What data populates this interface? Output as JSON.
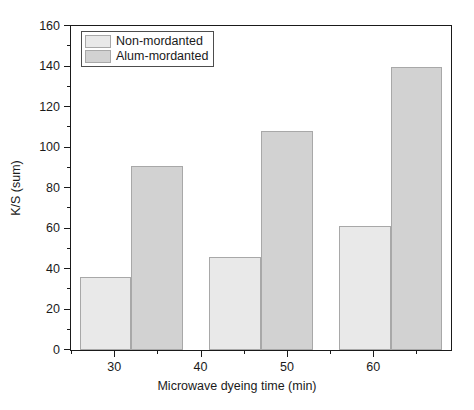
{
  "chart_data": {
    "type": "bar",
    "title": "",
    "xlabel": "Microwave dyeing time (min)",
    "ylabel": "K/S (sum)",
    "xlim": [
      25,
      69
    ],
    "ylim": [
      0,
      160
    ],
    "grid": false,
    "legend_position": "top-left",
    "x_ticks": [
      30,
      40,
      50,
      60
    ],
    "x_tick_labels": [
      "30",
      "40",
      "50",
      "60"
    ],
    "x_minor_ticks": [
      25,
      35,
      45,
      55,
      65
    ],
    "y_ticks": [
      0,
      20,
      40,
      60,
      80,
      100,
      120,
      140,
      160
    ],
    "y_tick_labels": [
      "0",
      "20",
      "40",
      "60",
      "80",
      "100",
      "120",
      "140",
      "160"
    ],
    "y_minor_ticks": [
      10,
      30,
      50,
      70,
      90,
      110,
      130,
      150
    ],
    "categories": [
      "30",
      "40",
      "50"
    ],
    "series": [
      {
        "name": "Non-mordanted",
        "color": "#e9e9e9",
        "edge_color": "#a8a8a8",
        "values": [
          36,
          46,
          61
        ]
      },
      {
        "name": "Alum-mordanted",
        "color": "#d2d2d2",
        "edge_color": "#a8a8a8",
        "values": [
          91,
          108,
          140
        ]
      }
    ],
    "bars": [
      {
        "label": "Non-mordanted",
        "group": "30",
        "value": 36,
        "x_start": 26.0,
        "x_end": 32.0,
        "color": "#e9e9e9"
      },
      {
        "label": "Alum-mordanted",
        "group": "30",
        "value": 91,
        "x_start": 32.0,
        "x_end": 38.0,
        "color": "#d2d2d2"
      },
      {
        "label": "Non-mordanted",
        "group": "40",
        "value": 46,
        "x_start": 41.0,
        "x_end": 47.0,
        "color": "#e9e9e9"
      },
      {
        "label": "Alum-mordanted",
        "group": "40",
        "value": 108,
        "x_start": 47.0,
        "x_end": 53.0,
        "color": "#d2d2d2"
      },
      {
        "label": "Non-mordanted",
        "group": "50",
        "value": 61,
        "x_start": 56.0,
        "x_end": 62.0,
        "color": "#e9e9e9"
      },
      {
        "label": "Alum-mordanted",
        "group": "50",
        "value": 140,
        "x_start": 62.0,
        "x_end": 68.0,
        "color": "#d2d2d2"
      }
    ],
    "legend": [
      {
        "label": "Non-mordanted",
        "color": "#e9e9e9"
      },
      {
        "label": "Alum-mordanted",
        "color": "#d2d2d2"
      }
    ]
  }
}
